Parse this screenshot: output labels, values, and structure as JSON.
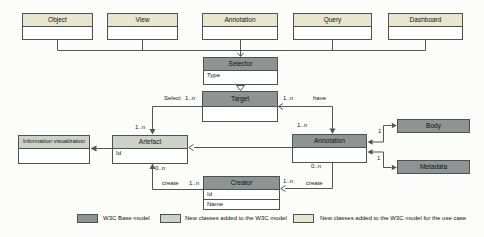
{
  "diagram": {
    "top_classes": [
      {
        "name": "Object"
      },
      {
        "name": "View"
      },
      {
        "name": "Annotation"
      },
      {
        "name": "Query"
      },
      {
        "name": "Dashboard"
      }
    ],
    "classes": {
      "selector": {
        "name": "Selector",
        "attributes": [
          "Type"
        ]
      },
      "target": {
        "name": "Target"
      },
      "information_visualization": {
        "name": "Information visualization"
      },
      "artefact": {
        "name": "Artefact",
        "attributes": [
          "Id"
        ]
      },
      "annotation": {
        "name": "Annotation"
      },
      "body": {
        "name": "Body"
      },
      "metadata": {
        "name": "Metadata"
      },
      "creator": {
        "name": "Creator",
        "attributes": [
          "Id",
          "Name"
        ]
      }
    },
    "edge_labels": {
      "select": "Select",
      "select_mult": "1..n",
      "artefact_in_mult": "1..n",
      "have": "have",
      "have_mult": "1..n",
      "annotation_in_mult": "1..n",
      "body_mult": "1",
      "metadata_mult": "1",
      "artefact_create_mult": "0..n",
      "create_left": "create",
      "create_left_mult": "1..n",
      "create_right_mult": "1..n",
      "create_right": "create",
      "annotation_create_mult": "0..n"
    }
  },
  "legend": {
    "items": [
      {
        "label": "W3C Base model",
        "color": "#8e9494"
      },
      {
        "label": "New classes added to the W3C model",
        "color": "#ccd2c8"
      },
      {
        "label": "New classes added to the W3C model for the use case",
        "color": "#e9e5cf"
      }
    ]
  },
  "colors": {
    "base_model": "#8e9494",
    "added_classes": "#ccd2c8",
    "use_case_classes": "#e9e5cf",
    "line": "#555555"
  }
}
